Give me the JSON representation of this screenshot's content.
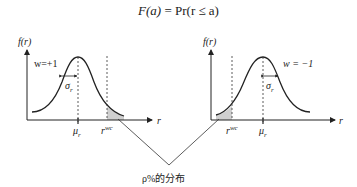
{
  "formula": {
    "lhs": "F(a)",
    "equals": "=",
    "rhs": "Pr(r ≤ a)"
  },
  "left_chart": {
    "y_label": "f(r)",
    "x_label": "r",
    "weight_label": "w=+1",
    "sigma_label": "σ",
    "sigma_sub": "r",
    "mu_label": "μ",
    "mu_sub": "r",
    "rwc_label": "r",
    "rwc_sup": "wc",
    "shaded_tail": "right"
  },
  "right_chart": {
    "y_label": "f(r)",
    "x_label": "r",
    "weight_label": "w = −1",
    "sigma_label": "σ",
    "sigma_sub": "r",
    "mu_label": "μ",
    "mu_sub": "r",
    "rwc_label": "r",
    "rwc_sup": "wc",
    "shaded_tail": "left"
  },
  "caption": "ρ%的分布",
  "colors": {
    "line": "#222222",
    "shade": "#cfcfcf",
    "dashed": "#333333"
  }
}
